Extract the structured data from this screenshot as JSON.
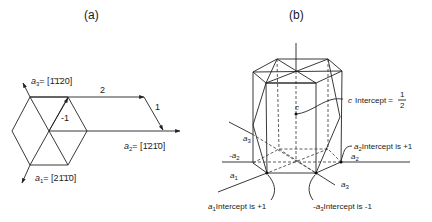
{
  "panels": {
    "a": {
      "label": "(a)",
      "vectors": {
        "a1": {
          "sym": "a",
          "sub": "1",
          "eq": "= [2",
          "idx": "1̄1̄",
          "tail": "0]"
        },
        "a2": {
          "sym": "a",
          "sub": "2",
          "eq": "= [",
          "idx": "1̄2",
          "tail": "1̄0]"
        },
        "a3": {
          "sym": "a",
          "sub": "3",
          "eq": "= [",
          "idx": "1̄1̄",
          "tail": "20]"
        }
      },
      "a1_text": "[2ő1̄0]",
      "steps": {
        "top": "2",
        "slant": "1",
        "inner": "-1"
      }
    },
    "b": {
      "label": "(b)",
      "c_label": "c",
      "c_intercept": {
        "text": "Intercept =",
        "num": "1",
        "den": "2",
        "axis": "c"
      },
      "a2_intercept": {
        "axis": "a",
        "sub": "2",
        "text": "Intercept is  +1"
      },
      "a1_intercept": {
        "axis": "a",
        "sub": "1",
        "text": "Intercept is  +1"
      },
      "a3_intercept": {
        "prefix": "-",
        "axis": "a",
        "sub": "3",
        "text": "Intercept is  -1"
      },
      "axes": {
        "a1": {
          "sym": "a",
          "sub": "1"
        },
        "a2": {
          "sym": "a",
          "sub": "2"
        },
        "neg_a2": {
          "sym": "-a",
          "sub": "2"
        },
        "a3_upper": {
          "sym": "a",
          "sub": "3"
        },
        "a3_lower": {
          "sym": "a",
          "sub": "3"
        }
      }
    }
  }
}
